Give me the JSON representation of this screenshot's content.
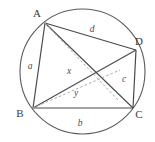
{
  "figure": {
    "canvas": {
      "width": 155,
      "height": 142,
      "background": "#ffffff"
    },
    "colors": {
      "circle_stroke": "#5a5a5a",
      "solid_stroke": "#4a4a4a",
      "dashed_stroke": "#a8a8a8",
      "label_color": "#3a3a3a",
      "side_label_color": "#4a4a4a"
    },
    "circle": {
      "cx": 82.5,
      "cy": 71.5,
      "r": 62.5
    },
    "vertices": [
      {
        "id": "A",
        "label": "A",
        "px": 45,
        "py": 23,
        "label_x": 37,
        "label_y": 17
      },
      {
        "id": "B",
        "label": "B",
        "px": 33,
        "py": 108,
        "label_x": 20,
        "label_y": 117
      },
      {
        "id": "C",
        "label": "C",
        "px": 133,
        "py": 108,
        "label_x": 139,
        "label_y": 118
      },
      {
        "id": "D",
        "label": "D",
        "px": 136,
        "py": 50,
        "label_x": 139,
        "label_y": 45
      }
    ],
    "sides": [
      {
        "id": "AB",
        "label": "a",
        "from": "A",
        "to": "B",
        "label_x": 30,
        "label_y": 69
      },
      {
        "id": "BC",
        "label": "b",
        "from": "B",
        "to": "C",
        "label_x": 80,
        "label_y": 126
      },
      {
        "id": "CD",
        "label": "c",
        "from": "C",
        "to": "D",
        "label_x": 124,
        "label_y": 82
      },
      {
        "id": "AD",
        "label": "d",
        "from": "A",
        "to": "D",
        "label_x": 92,
        "label_y": 32
      }
    ],
    "diagonals": [
      {
        "id": "AC",
        "label": "",
        "from": "A",
        "to": "C",
        "style": "solid"
      },
      {
        "id": "BD",
        "label": "",
        "from": "B",
        "to": "D",
        "style": "solid"
      }
    ],
    "construction_segments": [
      {
        "id": "x-segment",
        "label": "x",
        "style": "dashed",
        "x1": 45,
        "y1": 23,
        "x2": 118,
        "y2": 100,
        "label_x": 69,
        "label_y": 74
      },
      {
        "id": "y-segment",
        "label": "y",
        "style": "dashed",
        "x1": 33,
        "y1": 108,
        "x2": 120,
        "y2": 70,
        "label_x": 76,
        "label_y": 96
      }
    ]
  }
}
